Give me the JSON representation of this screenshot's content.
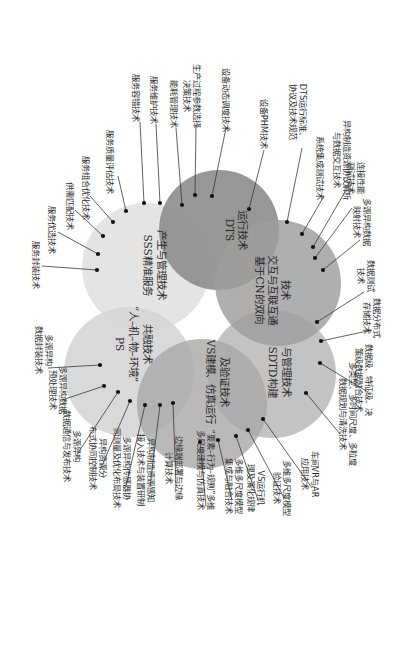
{
  "diagram": {
    "orientation": "rotated-90-clockwise",
    "colors": {
      "DTS": "#8f8f8f",
      "CN": "#a4a4a4",
      "SDTD": "#b9b9b9",
      "VS": "#aeaeae",
      "PS": "#d6d6d6",
      "SSS": "#e2e2e2"
    },
    "circles": [
      {
        "id": "DTS",
        "lines": [
          "DTS",
          "运行技术"
        ]
      },
      {
        "id": "CN",
        "lines": [
          "基于CN的双向",
          "交互与互联互通",
          "技术"
        ]
      },
      {
        "id": "SDTD",
        "lines": [
          "SDTD构建",
          "与管理技术"
        ]
      },
      {
        "id": "VS",
        "lines": [
          "VS建模、仿真运行",
          "及验证技术"
        ]
      },
      {
        "id": "PS",
        "lines": [
          "PS",
          "“人–机–物–环境”",
          "共融技术"
        ]
      },
      {
        "id": "SSS",
        "lines": [
          "SSS精准服务",
          "产生与管理技术"
        ]
      }
    ],
    "labels": [
      {
        "circle": "SSS",
        "lines": [
          "服务封装技术"
        ]
      },
      {
        "circle": "SSS",
        "lines": [
          "服务优选技术"
        ]
      },
      {
        "circle": "SSS",
        "lines": [
          "供需匹配技术"
        ]
      },
      {
        "circle": "SSS",
        "lines": [
          "服务组合优化技术"
        ]
      },
      {
        "circle": "SSS",
        "lines": [
          "服务质量评估技术"
        ]
      },
      {
        "circle": "SSS",
        "lines": [
          "服务容错技术"
        ]
      },
      {
        "circle": "SSS",
        "lines": [
          "服务维护技术"
        ]
      },
      {
        "circle": "DTS",
        "lines": [
          "能耗管理技术"
        ]
      },
      {
        "circle": "DTS",
        "lines": [
          "生产过程参数选择",
          "决策技术"
        ]
      },
      {
        "circle": "DTS",
        "lines": [
          "设备动态调度技术"
        ]
      },
      {
        "circle": "DTS",
        "lines": [
          "设备PHM技术"
        ]
      },
      {
        "circle": "DTS",
        "lines": [
          "DTS运行标准、",
          "协议及技术规范"
        ]
      },
      {
        "circle": "CN",
        "lines": [
          "系统集成测试技术"
        ]
      },
      {
        "circle": "CN",
        "lines": [
          "异构制造资源协议解析",
          "与数据交互技术"
        ]
      },
      {
        "circle": "CN",
        "lines": [
          "连接性能",
          "测试技术"
        ]
      },
      {
        "circle": "CN",
        "lines": [
          "多源异构数据",
          "映射技术"
        ]
      },
      {
        "circle": "CN",
        "lines": [
          "数据测试",
          "技术"
        ]
      },
      {
        "circle": "SDTD",
        "lines": [
          "数据分布式",
          "存储技术"
        ]
      },
      {
        "circle": "SDTD",
        "lines": [
          "数据级、特征级、决",
          "策级数据融合技术"
        ]
      },
      {
        "circle": "SDTD",
        "lines": [
          "多类型、多时间尺度、多粒度",
          "数据规划与清洗技术"
        ]
      },
      {
        "circle": "VS",
        "lines": [
          "车间VR与AR",
          "应用技术"
        ]
      },
      {
        "circle": "VS",
        "lines": [
          "多维多尺度模型",
          "验证技术"
        ]
      },
      {
        "circle": "VS",
        "lines": [
          "VS运行机",
          "理及演化规律"
        ]
      },
      {
        "circle": "VS",
        "lines": [
          "多维多尺度模型",
          "集成与融合技术"
        ]
      },
      {
        "circle": "VS",
        "lines": [
          "“要素–行为–规则”多维",
          "多尺度建模与仿真技术"
        ]
      },
      {
        "circle": "PS",
        "lines": [
          "边缘端部署与边缘",
          "计算技术"
        ]
      },
      {
        "circle": "PS",
        "lines": [
          "异构制造资源感知",
          "接入技术与装置研制"
        ]
      },
      {
        "circle": "PS",
        "lines": [
          "多源异构传感器协",
          "同测量及优化布局技术"
        ]
      },
      {
        "circle": "PS",
        "lines": [
          "异构资源分",
          "布式协同控制技术"
        ]
      },
      {
        "circle": "PS",
        "lines": [
          "多源异构",
          "数据通信与发布技术"
        ]
      },
      {
        "circle": "PS",
        "lines": [
          "多源异构数据",
          "预处理技术"
        ]
      },
      {
        "circle": "PS",
        "lines": [
          "多源异构",
          "数据封装技术"
        ]
      }
    ]
  }
}
